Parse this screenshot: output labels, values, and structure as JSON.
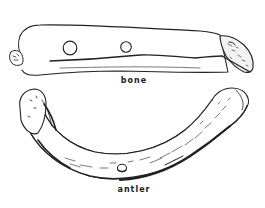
{
  "figure": {
    "items": [
      {
        "name": "bone",
        "label": "bone",
        "holes": 2
      },
      {
        "name": "antler",
        "label": "antler",
        "holes": 1
      }
    ],
    "colors": {
      "ink": "#222222",
      "paper": "#ffffff"
    }
  }
}
